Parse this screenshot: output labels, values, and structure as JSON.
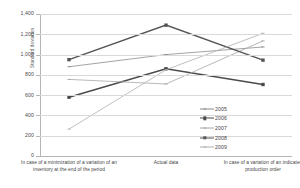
{
  "chart_data": {
    "type": "line",
    "title": "",
    "xlabel": "",
    "ylabel": "Standard deviation",
    "ylim": [
      0,
      1400
    ],
    "ytick_step": 200,
    "yticks": [
      "0",
      "200",
      "400",
      "600",
      "800",
      "1,000",
      "1,200",
      "1,400"
    ],
    "ytick_values": [
      0,
      200,
      400,
      600,
      800,
      1000,
      1200,
      1400
    ],
    "grid": true,
    "legend_position": "center-right",
    "categories": [
      "In case of a minimization of a variation of an inventory at the end of the period",
      "Actual data",
      "In case of a variation of an indicated production order"
    ],
    "series": [
      {
        "name": "2005",
        "values": [
          880,
          1000,
          1075
        ],
        "color": "#8c8c8c",
        "width": 0.8,
        "marker": "tick"
      },
      {
        "name": "2006",
        "values": [
          580,
          860,
          705
        ],
        "color": "#4a4a4a",
        "width": 1.5,
        "marker": "square"
      },
      {
        "name": "2007",
        "values": [
          755,
          710,
          1135
        ],
        "color": "#a6a6a6",
        "width": 0.8,
        "marker": "tick"
      },
      {
        "name": "2008",
        "values": [
          950,
          1290,
          945
        ],
        "color": "#555555",
        "width": 1.5,
        "marker": "square"
      },
      {
        "name": "2009",
        "values": [
          265,
          850,
          1210
        ],
        "color": "#b0b0b0",
        "width": 0.8,
        "marker": "tick"
      }
    ]
  },
  "axis": {
    "y_title": "Standard deviation"
  },
  "legend": {
    "entries": [
      {
        "label": "2005"
      },
      {
        "label": "2006"
      },
      {
        "label": "2007"
      },
      {
        "label": "2008"
      },
      {
        "label": "2009"
      }
    ]
  }
}
